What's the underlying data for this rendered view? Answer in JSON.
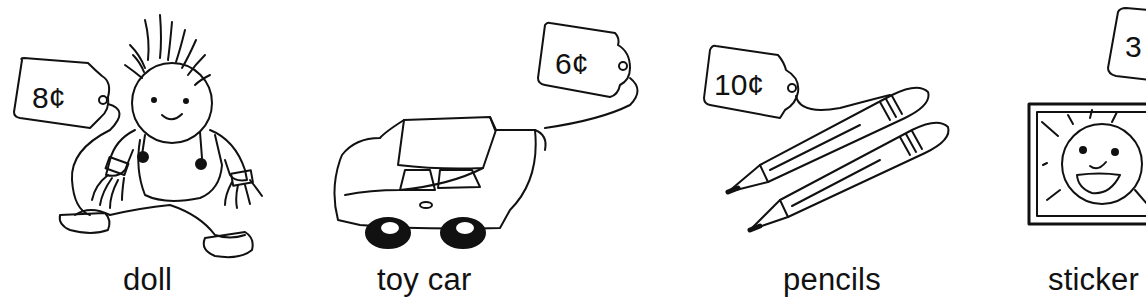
{
  "items": [
    {
      "name": "doll",
      "price": "8¢"
    },
    {
      "name": "toy car",
      "price": "6¢"
    },
    {
      "name": "pencils",
      "price": "10¢"
    },
    {
      "name": "sticker",
      "price": "3"
    }
  ],
  "colors": {
    "ink": "#111111",
    "background": "#ffffff"
  }
}
